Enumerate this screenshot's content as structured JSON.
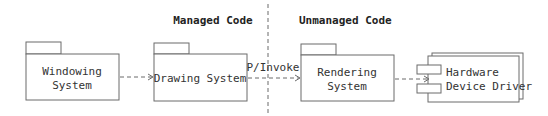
{
  "regions": {
    "managed": "Managed Code",
    "unmanaged": "Unmanaged Code"
  },
  "packages": [
    {
      "lines": [
        "Windowing",
        "System"
      ]
    },
    {
      "lines": [
        "Drawing System"
      ]
    },
    {
      "lines": [
        "Rendering",
        "System"
      ]
    }
  ],
  "component": {
    "lines": [
      "Hardware",
      "Device Driver"
    ]
  },
  "connectors": [
    {
      "from": "Windowing System",
      "to": "Drawing System",
      "label": ""
    },
    {
      "from": "Drawing System",
      "to": "Rendering System",
      "label": "P/Invoke"
    },
    {
      "from": "Rendering System",
      "to": "Hardware Device Driver",
      "label": ""
    }
  ],
  "colors": {
    "stroke": "#6b6b6b",
    "text": "#333333",
    "background": "#ffffff"
  }
}
